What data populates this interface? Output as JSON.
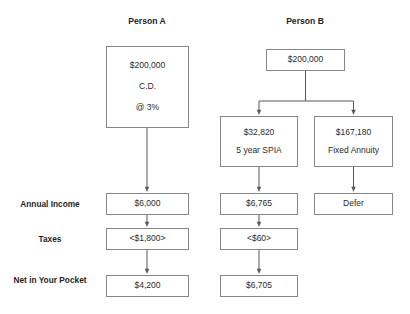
{
  "figure": {
    "columns": [
      {
        "id": "person-a",
        "title": "Person A"
      },
      {
        "id": "person-b",
        "title": "Person B"
      }
    ],
    "row_labels": [
      {
        "id": "annual-income",
        "line1": "Annual Income",
        "line2": ""
      },
      {
        "id": "taxes",
        "line1": "Taxes",
        "line2": ""
      },
      {
        "id": "net-in-your-pocket",
        "line1": "Net in Your",
        "line2": "Pocket"
      }
    ],
    "nodes": {
      "a_principal": {
        "line1": "$200,000",
        "line2": "C.D.",
        "line3": "@ 3%"
      },
      "a_income": {
        "line1": "$6,000"
      },
      "a_taxes": {
        "line1": "<$1,800>"
      },
      "a_net": {
        "line1": "$4,200"
      },
      "b_principal": {
        "line1": "$200,000"
      },
      "b_spia": {
        "line1": "$32,820",
        "line2": "5 year SPIA"
      },
      "b_fixed": {
        "line1": "$167,180",
        "line2": "Fixed Annuity"
      },
      "b_income": {
        "line1": "$6,765"
      },
      "b_defer": {
        "line1": "Defer"
      },
      "b_taxes": {
        "line1": "<$60>"
      },
      "b_net": {
        "line1": "$6,705"
      }
    },
    "colors": {
      "border": "#868686",
      "connector": "#595959",
      "text": "#2b2b2b",
      "background": "#ffffff"
    }
  }
}
